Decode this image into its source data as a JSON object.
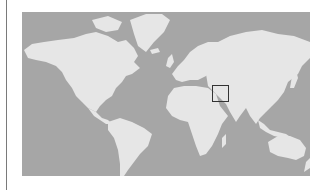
{
  "map": {
    "type": "world-map",
    "projection": "mercator",
    "colors": {
      "ocean": "#a6a6a6",
      "land": "#e6e6e6",
      "highlight_border": "#333333",
      "left_rule": "#7a7a7a"
    },
    "highlight": {
      "label": "",
      "region": "South Asia (India / Pakistan / Himalaya)",
      "shape": "square-outline"
    },
    "continents": [
      "North America",
      "South America",
      "Europe",
      "Africa",
      "Asia",
      "Australia",
      "Greenland"
    ]
  }
}
